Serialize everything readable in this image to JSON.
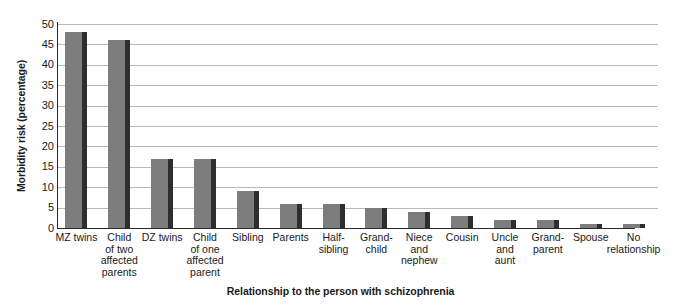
{
  "chart_data": {
    "type": "bar",
    "title": "",
    "xlabel": "Relationship to the person with schizophrenia",
    "ylabel": "Morbidity risk (percentage)",
    "categories": [
      "MZ twins",
      "Child of two affected parents",
      "DZ twins",
      "Child of one affected parent",
      "Sibling",
      "Parents",
      "Half-sibling",
      "Grand-child",
      "Niece and nephew",
      "Cousin",
      "Uncle and aunt",
      "Grand-parent",
      "Spouse",
      "No relationship"
    ],
    "category_lines": [
      "MZ twins",
      "Child\nof two\naffected\nparents",
      "DZ twins",
      "Child\nof one\naffected\nparent",
      "Sibling",
      "Parents",
      "Half-\nsibling",
      "Grand-\nchild",
      "Niece\nand\nnephew",
      "Cousin",
      "Uncle\nand\naunt",
      "Grand-\nparent",
      "Spouse",
      "No\nrelationship"
    ],
    "values": [
      48,
      46,
      17,
      17,
      9,
      6,
      6,
      5,
      4,
      3,
      2,
      2,
      1,
      1
    ],
    "ylim": [
      0,
      50
    ],
    "ytick_values": [
      0,
      5,
      10,
      15,
      20,
      25,
      30,
      35,
      40,
      45,
      50
    ],
    "ytick_labels": [
      "0",
      "5",
      "10",
      "15",
      "20",
      "25",
      "30",
      "35",
      "40",
      "45",
      "50"
    ],
    "grid": true,
    "legend": "none",
    "bar_color": "#7d7d7d",
    "bar_shadow_color": "#2e2e2e",
    "gridline_color": "#b9b9b9",
    "axis_color": "#2a2a2a"
  }
}
